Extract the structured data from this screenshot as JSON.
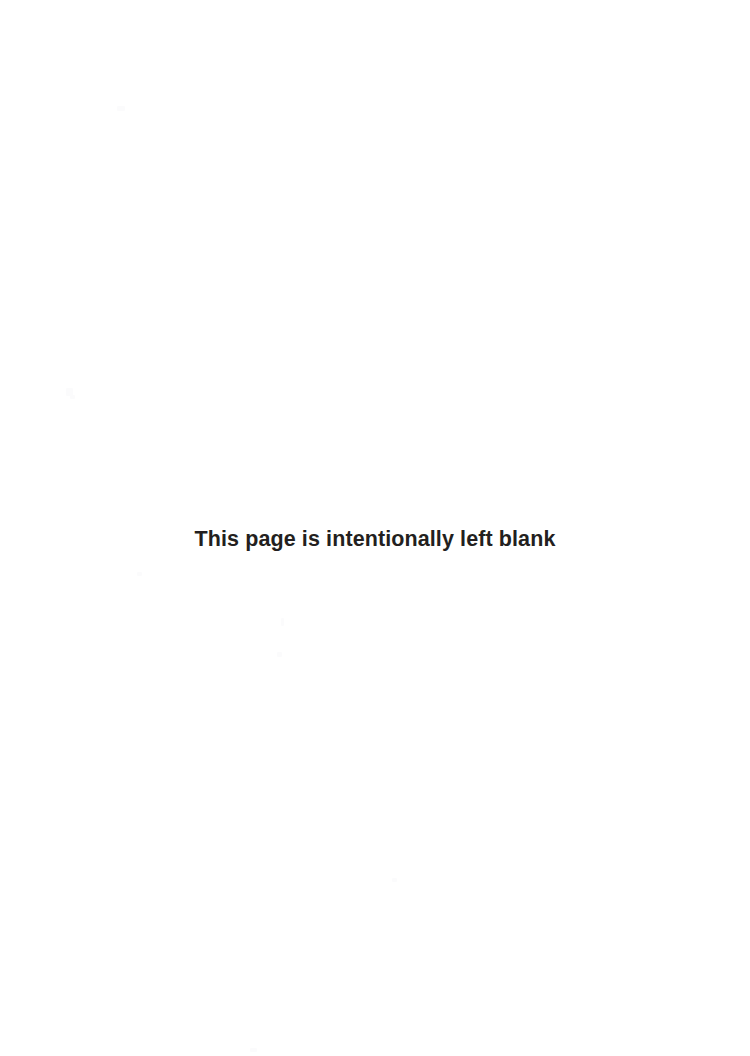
{
  "page": {
    "name": "blank-page",
    "background_color": "#ffffff",
    "width": 750,
    "height": 1056,
    "notice": {
      "text": "This page is intentionally left blank",
      "color": "#231f20",
      "weight": "bold",
      "alignment": "center"
    }
  },
  "artifacts": {
    "description": "faint scanner speckles",
    "count": 8
  }
}
